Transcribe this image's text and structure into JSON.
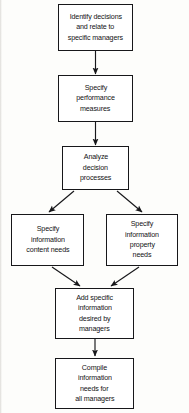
{
  "diagram": {
    "type": "flowchart",
    "orientation": "top-to-bottom",
    "stroke_color": "#17171a",
    "fill_color": "#ffffff",
    "background_color": "#fdfdfb",
    "nodes": [
      {
        "id": "identify",
        "lines": [
          "Identify decisions",
          "and relate to",
          "specific managers"
        ]
      },
      {
        "id": "specify_performance",
        "lines": [
          "Specify",
          "performance",
          "measures"
        ]
      },
      {
        "id": "analyze",
        "lines": [
          "Analyze",
          "decision",
          "processes"
        ]
      },
      {
        "id": "content_needs",
        "lines": [
          "Specify",
          "information",
          "content needs"
        ]
      },
      {
        "id": "property_needs",
        "lines": [
          "Specify",
          "information",
          "property",
          "needs"
        ]
      },
      {
        "id": "add_specific",
        "lines": [
          "Add specific",
          "information",
          "desired by",
          "managers"
        ]
      },
      {
        "id": "compile",
        "lines": [
          "Compile",
          "information",
          "needs for",
          "all managers"
        ]
      }
    ],
    "edges": [
      {
        "from": "identify",
        "to": "specify_performance",
        "style": "straight-down"
      },
      {
        "from": "specify_performance",
        "to": "analyze",
        "style": "straight-down"
      },
      {
        "from": "analyze",
        "to": "content_needs",
        "style": "diagonal-left"
      },
      {
        "from": "analyze",
        "to": "property_needs",
        "style": "diagonal-right"
      },
      {
        "from": "content_needs",
        "to": "add_specific",
        "style": "diagonal-right"
      },
      {
        "from": "property_needs",
        "to": "add_specific",
        "style": "diagonal-left"
      },
      {
        "from": "add_specific",
        "to": "compile",
        "style": "straight-down"
      }
    ]
  }
}
